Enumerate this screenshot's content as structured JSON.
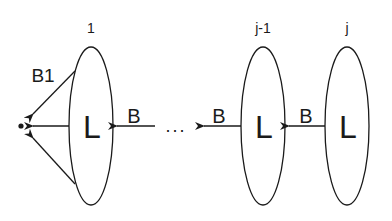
{
  "diagram": {
    "nodes": [
      {
        "id": "node-1",
        "index_label": "1",
        "inner_label": "L"
      },
      {
        "id": "node-j-1",
        "index_label": "j-1",
        "inner_label": "L"
      },
      {
        "id": "node-j",
        "index_label": "j",
        "inner_label": "L"
      }
    ],
    "edges": [
      {
        "from": "node-j",
        "to": "node-j-1",
        "label": "B"
      },
      {
        "from": "ellipsis",
        "to": "node-1",
        "label": "B"
      },
      {
        "from": "node-1",
        "to": "point",
        "label": "B1"
      }
    ],
    "ellipsis": "...",
    "point_label": "•",
    "colors": {
      "stroke": "#1a1a1a",
      "background": "#ffffff"
    }
  }
}
